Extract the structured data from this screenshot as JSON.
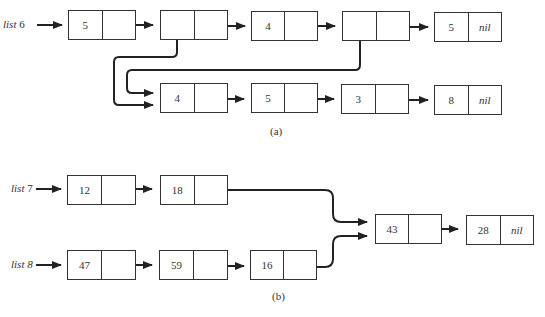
{
  "part_a": {
    "caption": "(a)",
    "list_label": "list",
    "list_number": "6",
    "top_row": [
      {
        "value": "5",
        "next": ""
      },
      {
        "value": "",
        "next": ""
      },
      {
        "value": "4",
        "next": ""
      },
      {
        "value": "",
        "next": ""
      },
      {
        "value": "5",
        "next": "nil"
      }
    ],
    "bottom_row": [
      {
        "value": "4",
        "next": ""
      },
      {
        "value": "5",
        "next": ""
      },
      {
        "value": "3",
        "next": ""
      },
      {
        "value": "8",
        "next": "nil"
      }
    ]
  },
  "part_b": {
    "caption": "(b)",
    "list7_label": "list",
    "list7_number": "7",
    "list8_label": "list",
    "list8_number": "8",
    "list7": [
      {
        "value": "12",
        "next": ""
      },
      {
        "value": "18",
        "next": ""
      }
    ],
    "list8": [
      {
        "value": "47",
        "next": ""
      },
      {
        "value": "59",
        "next": ""
      },
      {
        "value": "16",
        "next": ""
      }
    ],
    "shared": [
      {
        "value": "43",
        "next": ""
      },
      {
        "value": "28",
        "next": "nil"
      }
    ]
  }
}
